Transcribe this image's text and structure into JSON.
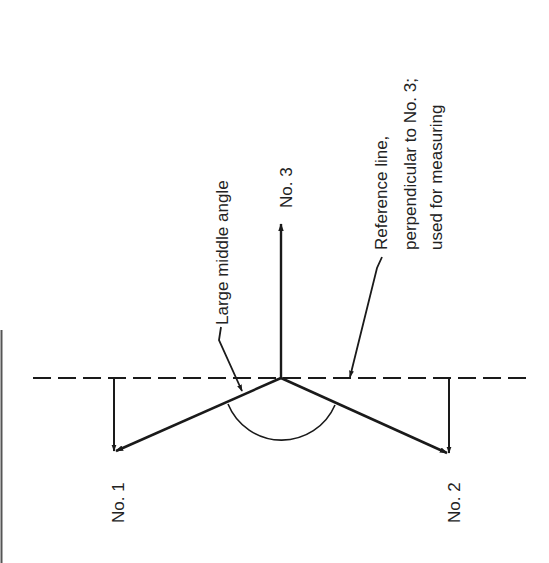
{
  "diagram": {
    "type": "vector-force-diagram",
    "orientation": "rotated-90-ccw",
    "labels": {
      "vector_1": "No. 1",
      "vector_2": "No. 2",
      "vector_3": "No. 3",
      "middle_angle": "Large middle angle",
      "reference_line_1": "Reference line,",
      "reference_line_2": "perpendicular to No. 3;",
      "reference_line_3": "used for measuring"
    },
    "elements": {
      "reference_line": {
        "style": "dashed",
        "description": "Reference line, perpendicular to No. 3; used for measuring"
      },
      "vectors": [
        {
          "id": "No. 1",
          "direction": "down-left from junction"
        },
        {
          "id": "No. 2",
          "direction": "down-right from junction"
        },
        {
          "id": "No. 3",
          "direction": "up from junction, perpendicular to reference line"
        }
      ],
      "arc": {
        "label": "Large middle angle",
        "between": [
          "No. 1",
          "No. 2"
        ]
      }
    },
    "colors": {
      "ink": "#1a1a1a",
      "background": "#ffffff"
    }
  }
}
